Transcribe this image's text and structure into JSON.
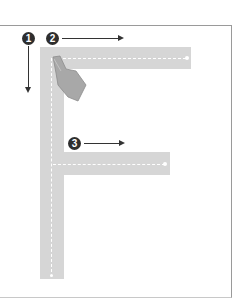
{
  "diagram": {
    "letter": "F",
    "steps": [
      {
        "number": "1",
        "direction": "down"
      },
      {
        "number": "2",
        "direction": "right"
      },
      {
        "number": "3",
        "direction": "right"
      }
    ],
    "colors": {
      "bar": "#d6d6d6",
      "badge": "#2e2e2e",
      "arrow": "#333333",
      "guide": "#ffffff",
      "hand": "#a8a8a8",
      "frame": "#9a9a9a"
    }
  }
}
